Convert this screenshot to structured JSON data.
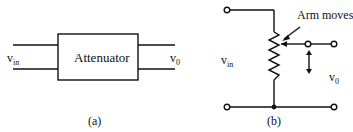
{
  "panel_a": {
    "block_label": "Attenuator",
    "input_label": "v",
    "input_sub": "in",
    "output_label": "v",
    "output_sub": "0",
    "caption": "(a)"
  },
  "panel_b": {
    "annotation": "Arm moves",
    "input_label": "v",
    "input_sub": "in",
    "output_label": "v",
    "output_sub": "0",
    "caption": "(b)"
  }
}
